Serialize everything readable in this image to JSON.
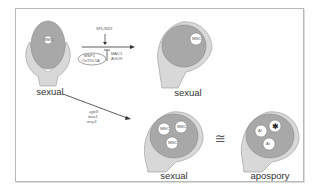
{
  "diagram": {
    "ovules": [
      {
        "id": "wild-type",
        "caption": "sexual",
        "cell_label": "MMC"
      },
      {
        "id": "wild-type-mmc",
        "caption": "sexual",
        "cell_label": "MMC"
      },
      {
        "id": "mutant-multiple-mmc",
        "caption": "sexual",
        "cell_labels": [
          "MMC",
          "MMC",
          "MMC"
        ]
      },
      {
        "id": "apospory",
        "caption": "apospory",
        "cell_labels": [
          "AI",
          "AI",
          "*"
        ]
      }
    ],
    "arrow_top": {
      "activator": "SPL/NZZ",
      "inhibitor_source": [
        "MSP1",
        "OsTDL1A"
      ],
      "inhibitor": [
        "MAC1",
        "AGO9"
      ]
    },
    "arrow_diag": {
      "mutants": [
        "ago9",
        "mac1",
        "msp1"
      ]
    },
    "equivalence_symbol": "≅"
  }
}
